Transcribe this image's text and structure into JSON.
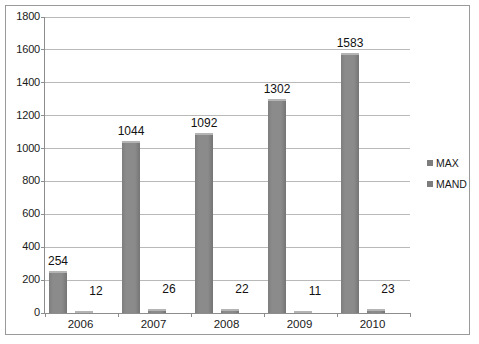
{
  "chart_data": {
    "type": "bar",
    "title": "",
    "subtitle": "",
    "xlabel": "",
    "ylabel": "",
    "categories": [
      "2006",
      "2007",
      "2008",
      "2009",
      "2010"
    ],
    "series": [
      {
        "name": "MAX",
        "values": [
          254,
          1044,
          1092,
          1302,
          1583
        ],
        "color": "#8b8b8b"
      },
      {
        "name": "MAND",
        "values": [
          12,
          26,
          22,
          11,
          23
        ],
        "color": "#8b8b8b"
      }
    ],
    "ylim": [
      0,
      1800
    ],
    "y_ticks": [
      0,
      200,
      400,
      600,
      800,
      1000,
      1200,
      1400,
      1600,
      1800
    ],
    "y_tick_labels": [
      "0",
      "200",
      "400",
      "600",
      "800",
      "1000",
      "1200",
      "1400",
      "1600",
      "1800"
    ],
    "grid": true,
    "grid_axis": "y",
    "data_labels": true,
    "legend": {
      "position": "right",
      "entries": [
        {
          "label": "MAX",
          "marker": "square-swatch-icon",
          "color": "#7d7d7d"
        },
        {
          "label": "MAND",
          "marker": "square-swatch-icon",
          "color": "#7d7d7d"
        }
      ]
    },
    "colors": {
      "bar_fill": "#8b8b8b",
      "bar_highlight": "#b4b4b4",
      "gridline": "#b9b9b9",
      "axis": "#8d8d8d",
      "frame": "#9a9a9a",
      "background": "#ffffff",
      "text": "#1a1a1a"
    }
  }
}
